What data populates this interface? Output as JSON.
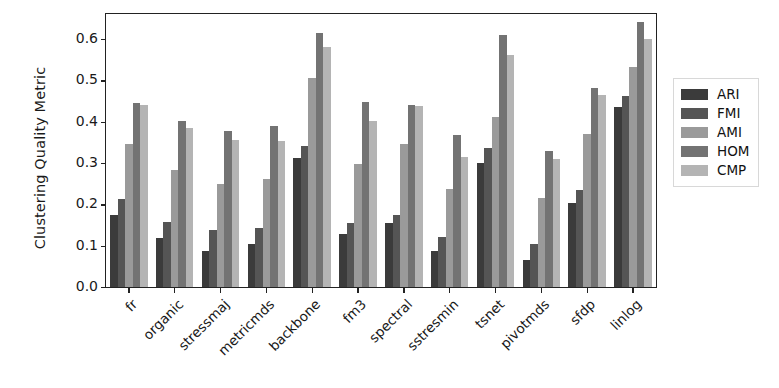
{
  "chart_data": {
    "type": "bar",
    "title": "",
    "xlabel": "",
    "ylabel": "Clustering Quality Metric",
    "ylim": [
      0.0,
      0.66
    ],
    "yticks": [
      0.0,
      0.1,
      0.2,
      0.3,
      0.4,
      0.5,
      0.6
    ],
    "ytick_labels": [
      "0.0",
      "0.1",
      "0.2",
      "0.3",
      "0.4",
      "0.5",
      "0.6"
    ],
    "grid": false,
    "legend_position": "right",
    "categories": [
      "fr",
      "organic",
      "stressmaj",
      "metricmds",
      "backbone",
      "fm3",
      "spectral",
      "sstresmin",
      "tsnet",
      "pivotmds",
      "sfdp",
      "linlog"
    ],
    "series": [
      {
        "name": "ARI",
        "color": "#3b3b3b",
        "values": [
          0.175,
          0.118,
          0.088,
          0.105,
          0.312,
          0.128,
          0.155,
          0.088,
          0.3,
          0.065,
          0.202,
          0.435
        ]
      },
      {
        "name": "FMI",
        "color": "#555555",
        "values": [
          0.212,
          0.158,
          0.138,
          0.142,
          0.34,
          0.155,
          0.175,
          0.122,
          0.335,
          0.105,
          0.235,
          0.462
        ]
      },
      {
        "name": "AMI",
        "color": "#9a9a9a",
        "values": [
          0.345,
          0.282,
          0.248,
          0.262,
          0.505,
          0.298,
          0.345,
          0.238,
          0.41,
          0.215,
          0.37,
          0.532
        ]
      },
      {
        "name": "HOM",
        "color": "#737373",
        "values": [
          0.445,
          0.402,
          0.378,
          0.39,
          0.615,
          0.448,
          0.44,
          0.368,
          0.61,
          0.33,
          0.48,
          0.64
        ]
      },
      {
        "name": "CMP",
        "color": "#b4b4b4",
        "values": [
          0.44,
          0.385,
          0.355,
          0.352,
          0.58,
          0.402,
          0.438,
          0.315,
          0.56,
          0.31,
          0.465,
          0.6
        ]
      }
    ]
  }
}
